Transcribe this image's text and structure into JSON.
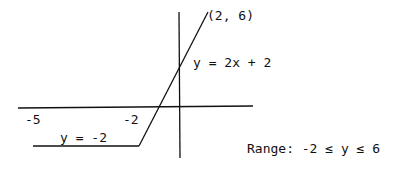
{
  "diagram": {
    "type": "piecewise-function-graph",
    "colors": {
      "line": "#111111",
      "background": "#ffffff"
    },
    "labels": {
      "endpoint": "(2, 6)",
      "line_equation": "y = 2x + 2",
      "flat_equation": "y = -2",
      "x_tick_neg5": "-5",
      "x_tick_neg2": "-2",
      "range": "Range: -2 ≤ y ≤ 6"
    },
    "segments": [
      {
        "name": "flat",
        "equation": "y = -2",
        "from": [
          -5,
          -2
        ],
        "to": [
          -2,
          -2
        ]
      },
      {
        "name": "slanted",
        "equation": "y = 2x + 2",
        "from": [
          -2,
          -2
        ],
        "to": [
          2,
          6
        ]
      }
    ]
  }
}
